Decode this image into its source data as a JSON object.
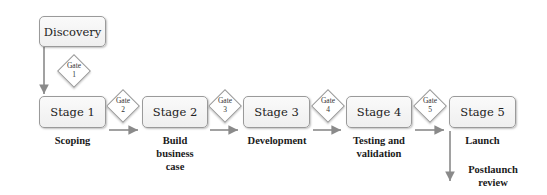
{
  "diagram": {
    "type": "stage-gate process",
    "discovery": {
      "label": "Discovery"
    },
    "gates": [
      {
        "id": 1,
        "line1": "Gate",
        "line2": "1"
      },
      {
        "id": 2,
        "line1": "Gate",
        "line2": "2"
      },
      {
        "id": 3,
        "line1": "Gate",
        "line2": "3"
      },
      {
        "id": 4,
        "line1": "Gate",
        "line2": "4"
      },
      {
        "id": 5,
        "line1": "Gate",
        "line2": "5"
      }
    ],
    "stages": [
      {
        "label": "Stage 1",
        "caption": [
          "Scoping"
        ]
      },
      {
        "label": "Stage 2",
        "caption": [
          "Build",
          "business",
          "case"
        ]
      },
      {
        "label": "Stage 3",
        "caption": [
          "Development"
        ]
      },
      {
        "label": "Stage 4",
        "caption": [
          "Testing and",
          "validation"
        ]
      },
      {
        "label": "Stage 5",
        "caption": [
          "Launch"
        ]
      }
    ],
    "postlaunch": {
      "line1": "Postlaunch",
      "line2": "review"
    },
    "colors": {
      "box_border": "#9a9a9a",
      "arrow": "#8a8a8a",
      "text": "#222222"
    }
  }
}
